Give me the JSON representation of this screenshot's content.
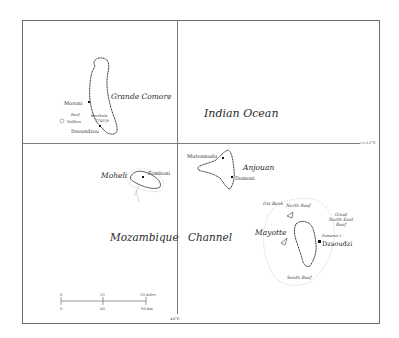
{
  "map": {
    "grid": {
      "latitude_label": "12°S",
      "longitude_label": "44°E"
    },
    "water_bodies": {
      "indian_ocean": "Indian Ocean",
      "mozambique": "Mozambique",
      "channel": "Channel"
    },
    "islands": {
      "grande_comore": {
        "name": "Grande Comore",
        "towns": [
          "Moroni",
          "Itsoundzou"
        ],
        "features": {
          "reef": "Reef",
          "vailheu": "Vailheu",
          "volcano": "Karthala",
          "volcano_height": "7740 ft"
        }
      },
      "moheli": {
        "name": "Moheli",
        "towns": [
          "Fomboni"
        ]
      },
      "anjouan": {
        "name": "Anjouan",
        "towns": [
          "Mutsamudu",
          "Domoni"
        ]
      },
      "mayotte": {
        "name": "Mayotte",
        "capital": "Dzaoudzi",
        "features": {
          "iris_bank": "Iris Bank",
          "north_reef": "North Reef",
          "great_ne_reef_1": "Great",
          "great_ne_reef_2": "North-East",
          "great_ne_reef_3": "Reef",
          "pamanzi": "Pamanzi I",
          "south_reef": "South Reef"
        }
      }
    },
    "scale_bar": {
      "miles": [
        "0",
        "25",
        "50 miles"
      ],
      "km": [
        "0",
        "40",
        "80 km"
      ]
    },
    "colors": {
      "line": "#6a6a6a",
      "coast": "#3a3a3a",
      "text": "#2a2a2a"
    }
  }
}
